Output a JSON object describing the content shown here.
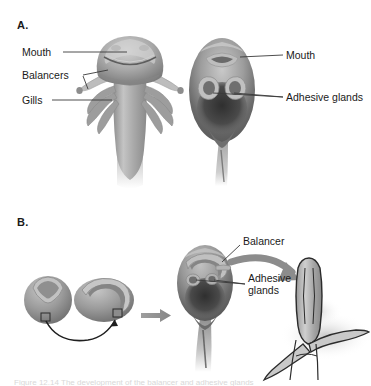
{
  "figure": {
    "background_color": "#ffffff",
    "ink_color": "#1a1a1a",
    "caption_partial": "Figure 12.14  The development of the balancer and adhesive glands"
  },
  "panels": [
    {
      "letter": "A.",
      "labels": [
        {
          "text": "Mouth",
          "side": "left"
        },
        {
          "text": "Balancers",
          "side": "left"
        },
        {
          "text": "Gills",
          "side": "left"
        },
        {
          "text": "Mouth",
          "side": "right"
        },
        {
          "text": "Adhesive glands",
          "side": "right"
        }
      ]
    },
    {
      "letter": "B.",
      "labels": [
        {
          "text": "Balancer",
          "side": "right"
        },
        {
          "text": "Adhesive glands",
          "side": "right"
        }
      ]
    }
  ],
  "panel_a": {
    "letter": "A.",
    "label_mouth_left": "Mouth",
    "label_balancers": "Balancers",
    "label_gills": "Gills",
    "label_mouth_right": "Mouth",
    "label_adhesive_glands": "Adhesive glands"
  },
  "panel_b": {
    "letter": "B.",
    "label_balancer": "Balancer",
    "label_adhesive_glands": "Adhesive glands"
  },
  "colors": {
    "tissue_light": "#d9d9d9",
    "tissue_mid": "#a8a8a8",
    "tissue_dark": "#6d6d6d",
    "tissue_darkest": "#3a3a3a",
    "arrow_gray": "#8c8c8c",
    "outline": "#2b2b2b",
    "leader_line": "#3a3a3a"
  }
}
